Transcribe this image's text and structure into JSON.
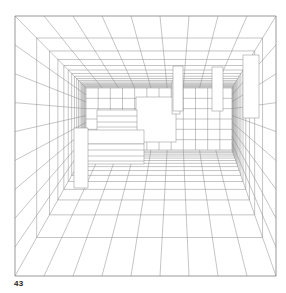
{
  "figure": {
    "label": "43",
    "line_color": "#8a8a8a",
    "background": "#ffffff"
  },
  "perspective": {
    "frame": {
      "x0": 15,
      "y0": 16,
      "x1": 276,
      "y1": 276
    },
    "back_wall": {
      "x0": 86,
      "y0": 88,
      "x1": 232,
      "y1": 150
    },
    "vanishing_point": {
      "x": 150,
      "y": 125
    },
    "depth_steps": 16,
    "wall_divisions_x": 9,
    "wall_divisions_y": 9
  }
}
